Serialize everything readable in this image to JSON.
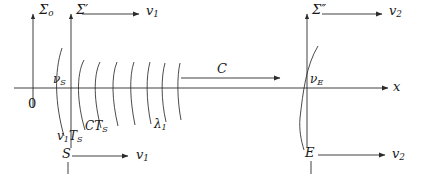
{
  "figure": {
    "background_color": "#ffffff",
    "stroke_color": "#2b2b2b",
    "text_color": "#1a1a1a",
    "width": 427,
    "height": 179
  },
  "axes": {
    "x_axis_label": "x",
    "origin_label": "0",
    "frames": [
      {
        "key": "sigma_o",
        "symbol": "Σ",
        "subscript": "o",
        "prime": ""
      },
      {
        "key": "sigma_prime",
        "symbol": "Σ",
        "subscript": "",
        "prime": "′"
      },
      {
        "key": "sigma_double_prime",
        "symbol": "Σ",
        "subscript": "",
        "prime": "″"
      }
    ]
  },
  "labels": {
    "sigma_o": "Σ",
    "sigma_o_sub": "o",
    "sigma_prime": "Σ′",
    "sigma_double_prime": "Σ″",
    "v1_top_left": "v",
    "v1_top_left_sub": "1",
    "v2_top_right": "v",
    "v2_top_right_sub": "2",
    "nu_S": "ν",
    "nu_S_sub": "S",
    "nu_E": "ν",
    "nu_E_sub": "E",
    "origin": "0",
    "v1_TS": "v",
    "v1_TS_sub1": "1",
    "v1_TS_mid": "T",
    "v1_TS_sub2": "S",
    "CTS": "CT",
    "CTS_sub": "S",
    "lambda1": "λ",
    "lambda1_sub": "1",
    "C": "C",
    "S": "S",
    "E": "E",
    "v1_bottom": "v",
    "v1_bottom_sub": "1",
    "v2_bottom": "v",
    "v2_bottom_sub": "2",
    "x_axis": "x"
  },
  "arrows": [
    {
      "name": "sigma-prime-velocity-arrow",
      "label": "v1",
      "direction": "right",
      "y": 14
    },
    {
      "name": "sigma-double-prime-velocity-arrow",
      "label": "v2",
      "direction": "right",
      "y": 14
    },
    {
      "name": "wave-propagation-arrow",
      "label": "C",
      "direction": "right",
      "y": 78
    },
    {
      "name": "source-velocity-arrow",
      "label": "v1",
      "direction": "right",
      "y": 156
    },
    {
      "name": "observer-velocity-arrow",
      "label": "v2",
      "direction": "right",
      "y": 155
    },
    {
      "name": "x-axis-arrow",
      "label": "x",
      "direction": "right",
      "y": 88
    }
  ],
  "wavefront_count": 8
}
